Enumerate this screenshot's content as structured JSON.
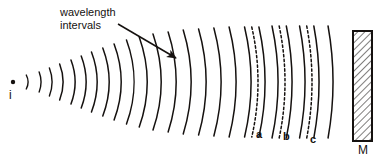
{
  "figure": {
    "background": "#ffffff",
    "ink": "#15110f",
    "width": 387,
    "height": 161
  },
  "annotation": {
    "line1": "wavelength",
    "line2": "intervals",
    "arrow": {
      "x1": 118,
      "y1": 24,
      "x2": 176,
      "y2": 58
    }
  },
  "source": {
    "label": "i",
    "dot": {
      "cx": 13,
      "cy": 82,
      "r": 2.2
    }
  },
  "mirror": {
    "label": "M",
    "rect": {
      "x": 353,
      "y": 31,
      "width": 19,
      "height": 110
    },
    "hatch_angle_deg": 45,
    "hatch_spacing": 5
  },
  "arc_labels": [
    {
      "id": "a",
      "label": "a",
      "x": 256,
      "y": 128
    },
    {
      "id": "b",
      "label": "b",
      "x": 283,
      "y": 130
    },
    {
      "id": "c",
      "label": "c",
      "x": 310,
      "y": 133
    }
  ],
  "chart_data": {
    "type": "line",
    "xlabel": "",
    "ylabel": "",
    "center": {
      "x": 13,
      "y": 82
    },
    "note": "Each arc is a circular wavefront centered on the source; radius increases by one wavelength interval per arc. Dashed arcs a, b, c mark selected wavefronts near the mirror.",
    "wavefronts": [
      {
        "index": 1,
        "radius": 15,
        "half_height": 7,
        "style": "solid"
      },
      {
        "index": 2,
        "radius": 28,
        "half_height": 10,
        "style": "solid"
      },
      {
        "index": 3,
        "radius": 39,
        "half_height": 14,
        "style": "solid"
      },
      {
        "index": 4,
        "radius": 50,
        "half_height": 18,
        "style": "solid"
      },
      {
        "index": 5,
        "radius": 62,
        "half_height": 22,
        "style": "solid"
      },
      {
        "index": 6,
        "radius": 73,
        "half_height": 26,
        "style": "solid"
      },
      {
        "index": 7,
        "radius": 84,
        "half_height": 30,
        "style": "solid"
      },
      {
        "index": 8,
        "radius": 96,
        "half_height": 34,
        "style": "solid"
      },
      {
        "index": 9,
        "radius": 108,
        "half_height": 38,
        "style": "solid"
      },
      {
        "index": 10,
        "radius": 121,
        "half_height": 42,
        "style": "solid"
      },
      {
        "index": 11,
        "radius": 134,
        "half_height": 45,
        "style": "solid"
      },
      {
        "index": 12,
        "radius": 148,
        "half_height": 48,
        "style": "solid"
      },
      {
        "index": 13,
        "radius": 163,
        "half_height": 50,
        "style": "solid"
      },
      {
        "index": 14,
        "radius": 178,
        "half_height": 52,
        "style": "solid"
      },
      {
        "index": 15,
        "radius": 193,
        "half_height": 53,
        "style": "solid"
      },
      {
        "index": 16,
        "radius": 208,
        "half_height": 54,
        "style": "solid"
      },
      {
        "index": 17,
        "radius": 223,
        "half_height": 55,
        "style": "solid"
      },
      {
        "index": 18,
        "radius": 238,
        "half_height": 55,
        "style": "solid"
      },
      {
        "index": 19,
        "radius": 245,
        "half_height": 55,
        "style": "dashed",
        "label": "a"
      },
      {
        "index": 20,
        "radius": 252,
        "half_height": 55,
        "style": "solid"
      },
      {
        "index": 21,
        "radius": 265,
        "half_height": 56,
        "style": "solid"
      },
      {
        "index": 22,
        "radius": 272,
        "half_height": 56,
        "style": "dashed",
        "label": "b"
      },
      {
        "index": 23,
        "radius": 279,
        "half_height": 56,
        "style": "solid"
      },
      {
        "index": 24,
        "radius": 292,
        "half_height": 56,
        "style": "solid"
      },
      {
        "index": 25,
        "radius": 299,
        "half_height": 56,
        "style": "dashed",
        "label": "c"
      },
      {
        "index": 26,
        "radius": 306,
        "half_height": 56,
        "style": "solid"
      },
      {
        "index": 27,
        "radius": 320,
        "half_height": 56,
        "style": "solid"
      }
    ]
  }
}
